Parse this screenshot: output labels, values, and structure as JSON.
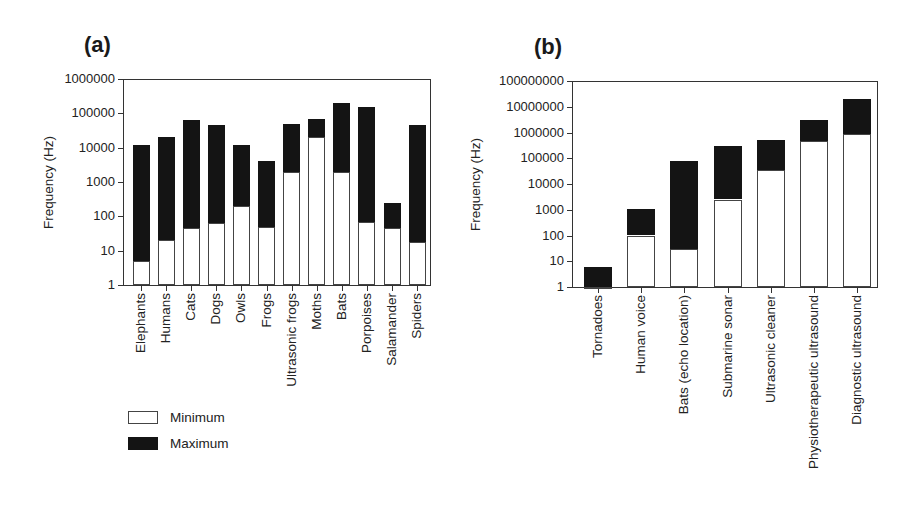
{
  "chart_data": [
    {
      "panel": "(a)",
      "type": "bar",
      "subtype": "floating-range-log",
      "title": "",
      "xlabel": "",
      "ylabel": "Frequency (Hz)",
      "yscale": "log",
      "ylim": [
        1,
        1000000
      ],
      "yticks": [
        "1",
        "10",
        "100",
        "1000",
        "10000",
        "100000",
        "1000000"
      ],
      "grid": false,
      "legend_position": "below-left",
      "categories": [
        "Elephants",
        "Humans",
        "Cats",
        "Dogs",
        "Owls",
        "Frogs",
        "Ultrasonic frogs",
        "Moths",
        "Bats",
        "Porpoises",
        "Salamander",
        "Spiders"
      ],
      "series": [
        {
          "name": "Minimum",
          "color": "#ffffff",
          "values": [
            5,
            20,
            45,
            65,
            200,
            50,
            2000,
            20000,
            2000,
            70,
            45,
            18
          ]
        },
        {
          "name": "Maximum",
          "color": "#141414",
          "values": [
            12000,
            20000,
            65000,
            45000,
            12000,
            4000,
            50000,
            70000,
            200000,
            150000,
            250,
            45000
          ]
        }
      ]
    },
    {
      "panel": "(b)",
      "type": "bar",
      "subtype": "floating-range-log",
      "title": "",
      "xlabel": "",
      "ylabel": "Frequency (Hz)",
      "yscale": "log",
      "ylim": [
        1,
        100000000
      ],
      "yticks": [
        "1",
        "10",
        "100",
        "1000",
        "10000",
        "100000",
        "1000000",
        "10000000",
        "100000000"
      ],
      "grid": false,
      "categories": [
        "Tornadoes",
        "Human voice",
        "Bats (echo location)",
        "Submarine sonar",
        "Ultrasonic cleaner",
        "Physiotherapeutic ultrasound",
        "Diagnostic ultrasound"
      ],
      "series": [
        {
          "name": "Minimum",
          "color": "#ffffff",
          "values": [
            1,
            100,
            30,
            2500,
            35000,
            450000,
            850000
          ]
        },
        {
          "name": "Maximum",
          "color": "#141414",
          "values": [
            6,
            1100,
            80000,
            290000,
            500000,
            3000000,
            20000000
          ]
        }
      ]
    }
  ],
  "panels": {
    "a": {
      "label": "(a)",
      "ylabel": "Frequency (Hz)"
    },
    "b": {
      "label": "(b)",
      "ylabel": "Frequency (Hz)"
    }
  },
  "legend": {
    "items": [
      {
        "label": "Minimum"
      },
      {
        "label": "Maximum"
      }
    ]
  }
}
